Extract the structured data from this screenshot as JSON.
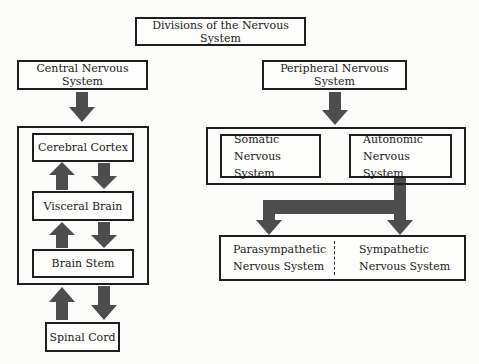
{
  "title": "Divisions of the Nervous System",
  "central": {
    "label": "Central Nervous System",
    "components": [
      "Cerebral Cortex",
      "Visceral Brain",
      "Brain Stem"
    ],
    "spinal_cord": "Spinal Cord"
  },
  "peripheral": {
    "label": "Peripheral Nervous System",
    "somatic": {
      "line1": "Somatic",
      "line2": "Nervous System"
    },
    "autonomic": {
      "line1": "Autonomic",
      "line2": "Nervous System"
    },
    "parasympathetic": {
      "line1": "Parasympathetic",
      "line2": "Nervous System"
    },
    "sympathetic": {
      "line1": "Sympathetic",
      "line2": "Nervous System"
    }
  },
  "colors": {
    "arrow": "#4a4a4a",
    "border": "#1e1e1e",
    "background": "#fbfbf9"
  }
}
